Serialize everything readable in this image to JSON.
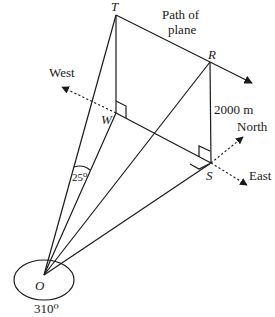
{
  "diagram": {
    "points": {
      "T": {
        "label": "T"
      },
      "R": {
        "label": "R"
      },
      "W": {
        "label": "W"
      },
      "S": {
        "label": "S"
      },
      "O": {
        "label": "O"
      }
    },
    "path_label_line1": "Path of",
    "path_label_line2": "plane",
    "height_label": "2000 m",
    "angle_label": "25⁰",
    "bearing_label": "310⁰",
    "directions": {
      "west": "West",
      "north": "North",
      "east": "East"
    },
    "stroke_color": "#1a1a1a",
    "background_color": "#ffffff"
  }
}
